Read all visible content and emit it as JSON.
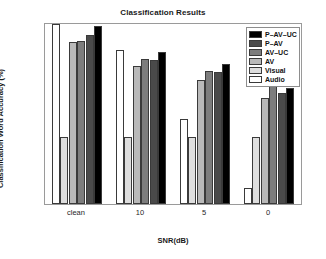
{
  "chart_data": {
    "type": "bar",
    "title": "Classification Results",
    "xlabel": "SNR(dB)",
    "ylabel": "Classification Word Accuracy (%)",
    "categories": [
      "clean",
      "10",
      "5",
      "0"
    ],
    "ylim": [
      50,
      100
    ],
    "yticks": [
      50,
      60,
      70,
      80,
      90,
      100
    ],
    "grid": false,
    "legend_position": "top-right",
    "series": [
      {
        "name": "P-AV-UC",
        "color": "#000000",
        "values": [
          99.5,
          92.2,
          88.9,
          82.2
        ]
      },
      {
        "name": "P-AV",
        "color": "#4a4a4a",
        "values": [
          96.9,
          90.1,
          86.6,
          80.8
        ]
      },
      {
        "name": "AV-UC",
        "color": "#7d7d7d",
        "values": [
          95.3,
          90.4,
          87.0,
          83.6
        ]
      },
      {
        "name": "AV",
        "color": "#b9b9b9",
        "values": [
          95.1,
          88.2,
          84.4,
          79.5
        ]
      },
      {
        "name": "Visual",
        "color": "#dedede",
        "values": [
          68.6,
          68.6,
          68.6,
          68.6
        ]
      },
      {
        "name": "Audio",
        "color": "#ffffff",
        "values": [
          100.0,
          92.7,
          73.7,
          54.5
        ]
      }
    ],
    "bar_draw_order": [
      "Audio",
      "Visual",
      "AV",
      "AV-UC",
      "P-AV",
      "P-AV-UC"
    ],
    "legend_order": [
      "P-AV-UC",
      "P-AV",
      "AV-UC",
      "AV",
      "Visual",
      "Audio"
    ]
  }
}
